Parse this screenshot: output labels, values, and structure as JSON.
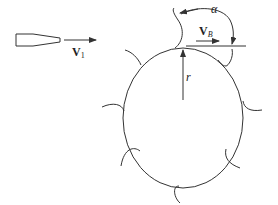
{
  "diagram": {
    "labels": {
      "jet_velocity": "V",
      "jet_velocity_sub": "1",
      "bucket_velocity": "V",
      "bucket_velocity_sub": "B",
      "radius": "r",
      "deflection_angle": "α"
    },
    "components": [
      "nozzle",
      "jet-velocity-arrow",
      "wheel",
      "buckets",
      "radius-arrow",
      "bucket-velocity-arrow",
      "angle-arc"
    ],
    "bucket_count": 8,
    "colors": {
      "stroke": "#333333",
      "background": "#ffffff"
    }
  }
}
